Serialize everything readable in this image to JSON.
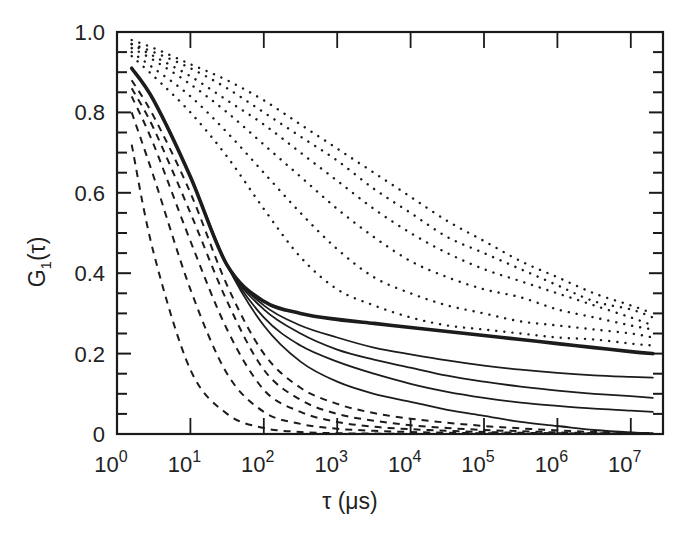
{
  "chart_data": {
    "type": "line",
    "title": "",
    "xlabel": "τ (μs)",
    "ylabel": "G1(τ)",
    "xscale": "log",
    "xlim": [
      1,
      20000000
    ],
    "ylim": [
      0,
      1.0
    ],
    "grid": false,
    "legend": null,
    "x_ticks": [
      {
        "base": "10",
        "exp": "0",
        "value": 1
      },
      {
        "base": "10",
        "exp": "1",
        "value": 10
      },
      {
        "base": "10",
        "exp": "2",
        "value": 100
      },
      {
        "base": "10",
        "exp": "3",
        "value": 1000
      },
      {
        "base": "10",
        "exp": "4",
        "value": 10000
      },
      {
        "base": "10",
        "exp": "5",
        "value": 100000
      },
      {
        "base": "10",
        "exp": "6",
        "value": 1000000
      },
      {
        "base": "10",
        "exp": "7",
        "value": 10000000
      }
    ],
    "y_ticks": [
      {
        "label": "0",
        "value": 0
      },
      {
        "label": "0.2",
        "value": 0.2
      },
      {
        "label": "0.4",
        "value": 0.4
      },
      {
        "label": "0.6",
        "value": 0.6
      },
      {
        "label": "0.8",
        "value": 0.8
      },
      {
        "label": "1.0",
        "value": 1.0
      }
    ],
    "x_log_points": [
      0.2,
      0.5,
      1,
      1.5,
      2,
      2.5,
      3,
      3.5,
      4,
      4.5,
      5,
      5.5,
      6,
      6.5,
      7,
      7.3
    ],
    "series": [
      {
        "name": "dashed-1",
        "style": "dashed",
        "values": [
          0.72,
          0.45,
          0.16,
          0.05,
          0.015,
          0.005,
          0.002,
          0.001,
          0,
          0,
          0,
          0,
          0,
          0,
          0,
          0
        ]
      },
      {
        "name": "dashed-2",
        "style": "dashed",
        "values": [
          0.8,
          0.64,
          0.36,
          0.15,
          0.055,
          0.025,
          0.013,
          0.008,
          0.005,
          0.003,
          0.002,
          0.001,
          0,
          0,
          0,
          0
        ]
      },
      {
        "name": "dashed-3",
        "style": "dashed",
        "values": [
          0.84,
          0.72,
          0.48,
          0.26,
          0.11,
          0.055,
          0.03,
          0.018,
          0.012,
          0.008,
          0.005,
          0.003,
          0.002,
          0.001,
          0,
          0
        ]
      },
      {
        "name": "dashed-4",
        "style": "dashed",
        "values": [
          0.86,
          0.76,
          0.55,
          0.33,
          0.16,
          0.085,
          0.05,
          0.033,
          0.022,
          0.015,
          0.01,
          0.007,
          0.004,
          0.002,
          0.001,
          0
        ]
      },
      {
        "name": "dashed-5",
        "style": "dashed",
        "values": [
          0.88,
          0.79,
          0.6,
          0.37,
          0.2,
          0.115,
          0.075,
          0.052,
          0.038,
          0.028,
          0.02,
          0.014,
          0.009,
          0.005,
          0.003,
          0.002
        ]
      },
      {
        "name": "solid-1",
        "style": "solid",
        "values": [
          0.91,
          0.83,
          0.64,
          0.42,
          0.27,
          0.18,
          0.13,
          0.1,
          0.08,
          0.06,
          0.045,
          0.03,
          0.02,
          0.01,
          0.004,
          0.002
        ]
      },
      {
        "name": "solid-2",
        "style": "solid",
        "values": [
          0.91,
          0.83,
          0.64,
          0.42,
          0.29,
          0.22,
          0.18,
          0.15,
          0.125,
          0.105,
          0.09,
          0.078,
          0.07,
          0.063,
          0.058,
          0.055
        ]
      },
      {
        "name": "solid-3",
        "style": "solid",
        "values": [
          0.91,
          0.83,
          0.64,
          0.42,
          0.31,
          0.25,
          0.21,
          0.185,
          0.165,
          0.145,
          0.13,
          0.118,
          0.108,
          0.1,
          0.094,
          0.09
        ]
      },
      {
        "name": "solid-4",
        "style": "solid",
        "values": [
          0.91,
          0.83,
          0.64,
          0.42,
          0.32,
          0.27,
          0.24,
          0.215,
          0.198,
          0.183,
          0.17,
          0.16,
          0.152,
          0.146,
          0.142,
          0.14
        ]
      },
      {
        "name": "solid-thick",
        "style": "solid-bold",
        "values": [
          0.91,
          0.83,
          0.64,
          0.42,
          0.33,
          0.3,
          0.285,
          0.275,
          0.265,
          0.255,
          0.245,
          0.235,
          0.225,
          0.215,
          0.205,
          0.2
        ]
      },
      {
        "name": "dotted-1",
        "style": "dotted",
        "values": [
          0.94,
          0.89,
          0.8,
          0.69,
          0.56,
          0.44,
          0.36,
          0.32,
          0.29,
          0.27,
          0.26,
          0.25,
          0.24,
          0.235,
          0.225,
          0.22
        ]
      },
      {
        "name": "dotted-2",
        "style": "dotted",
        "values": [
          0.95,
          0.91,
          0.84,
          0.75,
          0.65,
          0.55,
          0.46,
          0.39,
          0.35,
          0.32,
          0.3,
          0.28,
          0.27,
          0.26,
          0.25,
          0.24
        ]
      },
      {
        "name": "dotted-3",
        "style": "dotted",
        "values": [
          0.96,
          0.93,
          0.87,
          0.8,
          0.72,
          0.64,
          0.56,
          0.49,
          0.43,
          0.39,
          0.36,
          0.34,
          0.31,
          0.29,
          0.27,
          0.26
        ]
      },
      {
        "name": "dotted-4",
        "style": "dotted",
        "values": [
          0.97,
          0.94,
          0.89,
          0.83,
          0.77,
          0.7,
          0.63,
          0.56,
          0.5,
          0.45,
          0.41,
          0.38,
          0.35,
          0.32,
          0.29,
          0.27
        ]
      },
      {
        "name": "dotted-5",
        "style": "dotted",
        "values": [
          0.97,
          0.95,
          0.91,
          0.86,
          0.8,
          0.74,
          0.68,
          0.61,
          0.55,
          0.49,
          0.45,
          0.41,
          0.37,
          0.33,
          0.31,
          0.29
        ]
      },
      {
        "name": "dotted-6",
        "style": "dotted",
        "values": [
          0.98,
          0.96,
          0.92,
          0.88,
          0.83,
          0.77,
          0.71,
          0.65,
          0.59,
          0.53,
          0.48,
          0.43,
          0.39,
          0.35,
          0.32,
          0.3
        ]
      }
    ]
  },
  "axes": {
    "xlabel": "τ (μs)",
    "ylabel_main": "G",
    "ylabel_sub": "1",
    "ylabel_arg": "(τ)"
  }
}
